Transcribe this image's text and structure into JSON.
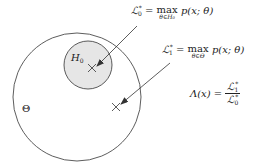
{
  "diagram": {
    "outer_set_label": "Θ",
    "inner_set_label": "H",
    "inner_set_label_sub": "0",
    "colors": {
      "outer_fill": "#ffffff",
      "inner_fill": "#e6e6e6",
      "stroke": "#333333"
    },
    "annotations": [
      {
        "id": "L0",
        "lhs": "ℒ",
        "lhs_sub": "0",
        "lhs_sup": "*",
        "eq": "=",
        "op": "max",
        "under": "θ∈H₀",
        "rhs": "p(x; θ)"
      },
      {
        "id": "L1",
        "lhs": "ℒ",
        "lhs_sub": "1",
        "lhs_sup": "*",
        "eq": "=",
        "op": "max",
        "under": "θ∈Θ",
        "rhs": "p(x; θ)"
      }
    ],
    "ratio": {
      "lhs": "Λ(x)",
      "eq": "=",
      "num": "ℒ",
      "num_sub": "1",
      "num_sup": "*",
      "den": "ℒ",
      "den_sub": "0",
      "den_sup": "*"
    },
    "markers": [
      "×",
      "×"
    ]
  }
}
